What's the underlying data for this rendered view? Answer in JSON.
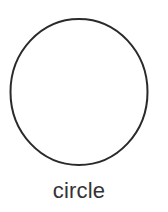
{
  "figure": {
    "shape": {
      "type": "circle",
      "cx": 79,
      "cy": 92,
      "rx": 68.5,
      "ry": 73,
      "stroke": "#2a2a2a",
      "stroke_width": 2,
      "fill": "#ffffff"
    },
    "caption": "circle",
    "caption_color": "#333333"
  }
}
